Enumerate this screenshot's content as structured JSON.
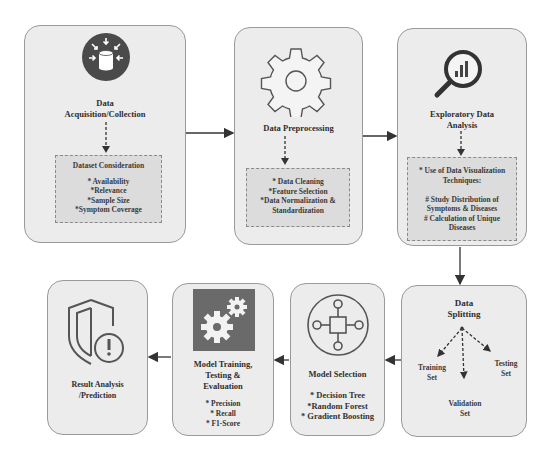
{
  "nodes": {
    "acquisition": {
      "title_lines": [
        "Data",
        "Acquisition/Collection"
      ],
      "icon": "database-arrows-icon",
      "sub_title": "Dataset Consideration",
      "sub_items": [
        "* Availability",
        "*Relevance",
        "*Sample Size",
        "*Symptom Coverage"
      ]
    },
    "preprocessing": {
      "title": "Data Preprocessing",
      "icon": "gear-icon",
      "sub_items": [
        "* Data Cleaning",
        "*Feature Selection",
        "*Data Normalization &",
        "Standardization"
      ]
    },
    "eda": {
      "title_lines": [
        "Exploratory Data",
        "Analysis"
      ],
      "icon": "magnifier-chart-icon",
      "sub_items": [
        "* Use of Data Visualization",
        "Techniques:",
        "",
        "# Study Distribution of",
        "Symptoms & Diseases",
        "# Calculation of Unique",
        "Diseases"
      ]
    },
    "splitting": {
      "title_lines": [
        "Data",
        "Splitting"
      ],
      "branches": [
        {
          "lines": [
            "Training",
            "Set"
          ]
        },
        {
          "lines": [
            "Validation",
            "Set"
          ]
        },
        {
          "lines": [
            "Testing",
            "Set"
          ]
        }
      ]
    },
    "model_selection": {
      "title": "Model Selection",
      "icon": "network-node-icon",
      "items": [
        "* Decision Tree",
        "*Random Forest",
        "* Gradient Boosting"
      ]
    },
    "model_training": {
      "title_lines": [
        "Model Training,",
        "Testing &",
        "Evaluation"
      ],
      "icon": "gears-icon",
      "items": [
        "* Precision",
        "* Recall",
        "* F1-Score"
      ]
    },
    "result": {
      "title_lines": [
        "Result Analysis",
        "/Prediction"
      ],
      "icon": "shield-alert-icon"
    }
  },
  "colors": {
    "box_fill": "#ececec",
    "box_border": "#9a9a9a",
    "inner_fill": "#dcdcdc",
    "icon_dark": "#4a4a4a",
    "arrow": "#333333"
  }
}
